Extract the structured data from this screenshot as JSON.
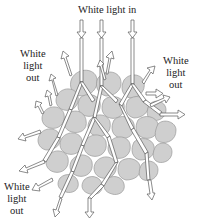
{
  "diagram": {
    "labels": {
      "top": "White light in",
      "left_upper": [
        "White",
        "light",
        "out"
      ],
      "right_upper": [
        "White",
        "light",
        "out"
      ],
      "left_lower": [
        "White",
        "light",
        "out"
      ]
    },
    "colors": {
      "particle_fill": "#cfcfcf",
      "particle_stroke": "#9a9a9a",
      "ray_fill": "#ffffff",
      "ray_stroke": "#5a5a5a",
      "text": "#222222"
    },
    "incoming_rays": 3
  }
}
